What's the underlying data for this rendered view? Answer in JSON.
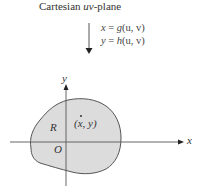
{
  "title": {
    "prefix": "Cartesian ",
    "italic": "uv",
    "suffix": "-plane"
  },
  "mapping": {
    "arrow_direction": "down",
    "equations": [
      {
        "lhs": "x",
        "eq": " = ",
        "func": "g",
        "args": "(u, v)"
      },
      {
        "lhs": "y",
        "eq": " = ",
        "func": "h",
        "args": "(u, v)"
      }
    ]
  },
  "plane": {
    "x_axis_label": "x",
    "y_axis_label": "y",
    "origin_label": "O",
    "region_label": "R",
    "point_label": "(x, y)",
    "region_fill": "#dcdcdc",
    "region_stroke": "#555555",
    "axis_color": "#555555"
  }
}
